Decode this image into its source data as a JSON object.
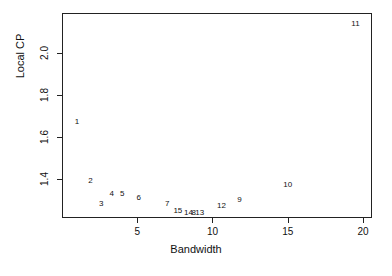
{
  "chart_data": {
    "type": "scatter",
    "title": "",
    "xlabel": "Bandwidth",
    "ylabel": "Local CP",
    "xlim": [
      0.0,
      20.6
    ],
    "ylim": [
      1.215,
      2.19
    ],
    "xticks": [
      5,
      10,
      15,
      20
    ],
    "xticklabels": [
      "5",
      "10",
      "15",
      "20"
    ],
    "yticks": [
      1.4,
      1.6,
      1.8,
      2.0
    ],
    "yticklabels": [
      "1.4",
      "1.6",
      "1.8",
      "2.0"
    ],
    "grid": false,
    "legend": null,
    "marker_style": "text-label",
    "points": [
      {
        "label": "1",
        "x": 1.0,
        "y": 1.67
      },
      {
        "label": "2",
        "x": 1.9,
        "y": 1.39
      },
      {
        "label": "3",
        "x": 2.6,
        "y": 1.28
      },
      {
        "label": "4",
        "x": 3.3,
        "y": 1.33
      },
      {
        "label": "5",
        "x": 4.0,
        "y": 1.33
      },
      {
        "label": "6",
        "x": 5.1,
        "y": 1.31
      },
      {
        "label": "7",
        "x": 7.0,
        "y": 1.28
      },
      {
        "label": "15",
        "x": 7.7,
        "y": 1.25
      },
      {
        "label": "14",
        "x": 8.4,
        "y": 1.24
      },
      {
        "label": "8",
        "x": 8.75,
        "y": 1.24
      },
      {
        "label": "13",
        "x": 9.15,
        "y": 1.24
      },
      {
        "label": "12",
        "x": 10.6,
        "y": 1.27
      },
      {
        "label": "9",
        "x": 11.8,
        "y": 1.3
      },
      {
        "label": "10",
        "x": 15.0,
        "y": 1.37
      },
      {
        "label": "11",
        "x": 19.5,
        "y": 2.14
      }
    ]
  }
}
